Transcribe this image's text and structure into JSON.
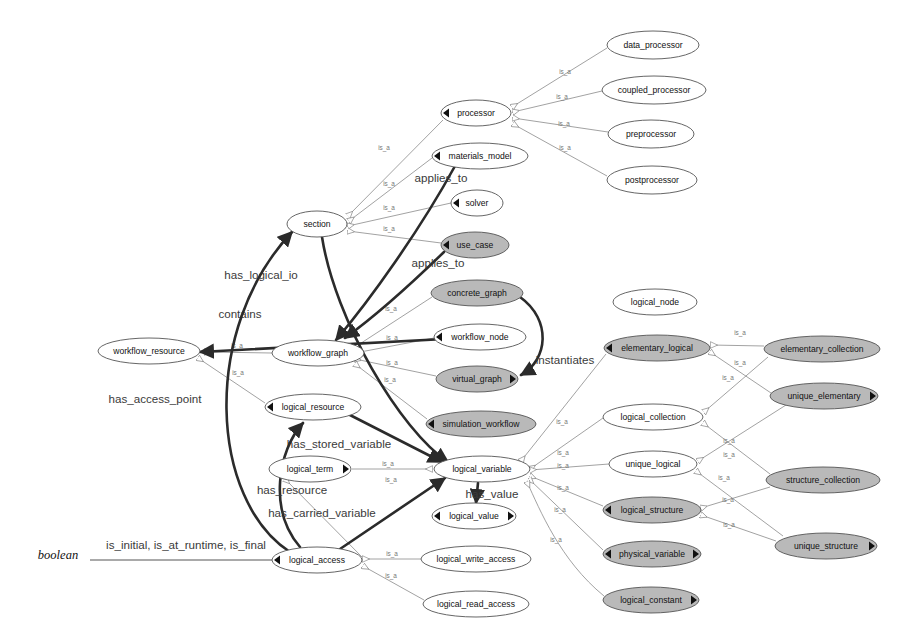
{
  "diagram": {
    "background": "#ffffff",
    "styles": {
      "node_fill_plain": "#ffffff",
      "node_fill_shaded": "#b9b9b9",
      "node_stroke": "#555555",
      "edge_isa_color": "#8a8a8a",
      "edge_rel_color": "#2b2b2b",
      "isa_label_color": "#777777",
      "rel_label_color": "#3a3a3a"
    },
    "legend_note": "white ellipse = plain class, gray ellipse = shaded class",
    "external_labels": [
      {
        "id": "boolean",
        "text": "boolean",
        "x": 58,
        "y": 559,
        "style": "italic"
      }
    ],
    "nodes": [
      {
        "id": "data_processor",
        "label": "data_processor",
        "cx": 653,
        "cy": 45,
        "rx": 46,
        "ry": 14,
        "shaded": false,
        "marker": "none"
      },
      {
        "id": "coupled_processor",
        "label": "coupled_processor",
        "cx": 654,
        "cy": 90,
        "rx": 52,
        "ry": 14,
        "shaded": false,
        "marker": "none"
      },
      {
        "id": "preprocessor",
        "label": "preprocessor",
        "cx": 651,
        "cy": 134,
        "rx": 43,
        "ry": 14,
        "shaded": false,
        "marker": "none"
      },
      {
        "id": "postprocessor",
        "label": "postprocessor",
        "cx": 652,
        "cy": 180,
        "rx": 45,
        "ry": 14,
        "shaded": false,
        "marker": "none"
      },
      {
        "id": "processor",
        "label": "processor",
        "cx": 476,
        "cy": 113,
        "rx": 35,
        "ry": 13,
        "shaded": false,
        "marker": "left"
      },
      {
        "id": "materials_model",
        "label": "materials_model",
        "cx": 480,
        "cy": 156,
        "rx": 48,
        "ry": 13,
        "shaded": false,
        "marker": "left"
      },
      {
        "id": "solver",
        "label": "solver",
        "cx": 477,
        "cy": 203,
        "rx": 26,
        "ry": 13,
        "shaded": false,
        "marker": "left"
      },
      {
        "id": "use_case",
        "label": "use_case",
        "cx": 475,
        "cy": 245,
        "rx": 34,
        "ry": 13,
        "shaded": true,
        "marker": "left"
      },
      {
        "id": "section",
        "label": "section",
        "cx": 317,
        "cy": 224,
        "rx": 30,
        "ry": 13,
        "shaded": false,
        "marker": "none"
      },
      {
        "id": "concrete_graph",
        "label": "concrete_graph",
        "cx": 477,
        "cy": 293,
        "rx": 46,
        "ry": 13,
        "shaded": true,
        "marker": "none"
      },
      {
        "id": "logical_node",
        "label": "logical_node",
        "cx": 655,
        "cy": 302,
        "rx": 42,
        "ry": 13,
        "shaded": false,
        "marker": "none"
      },
      {
        "id": "workflow_node",
        "label": "workflow_node",
        "cx": 480,
        "cy": 337,
        "rx": 46,
        "ry": 13,
        "shaded": false,
        "marker": "left"
      },
      {
        "id": "workflow_graph",
        "label": "workflow_graph",
        "cx": 318,
        "cy": 353,
        "rx": 46,
        "ry": 13,
        "shaded": false,
        "marker": "none"
      },
      {
        "id": "workflow_resource",
        "label": "workflow_resource",
        "cx": 149,
        "cy": 351,
        "rx": 51,
        "ry": 13,
        "shaded": false,
        "marker": "none"
      },
      {
        "id": "virtual_graph",
        "label": "virtual_graph",
        "cx": 477,
        "cy": 379,
        "rx": 41,
        "ry": 13,
        "shaded": true,
        "marker": "right"
      },
      {
        "id": "elementary_logical",
        "label": "elementary_logical",
        "cx": 657,
        "cy": 348,
        "rx": 53,
        "ry": 13,
        "shaded": true,
        "marker": "left"
      },
      {
        "id": "elementary_collection",
        "label": "elementary_collection",
        "cx": 822,
        "cy": 349,
        "rx": 58,
        "ry": 13,
        "shaded": true,
        "marker": "none"
      },
      {
        "id": "unique_elementary",
        "label": "unique_elementary",
        "cx": 824,
        "cy": 396,
        "rx": 54,
        "ry": 13,
        "shaded": true,
        "marker": "right"
      },
      {
        "id": "logical_collection",
        "label": "logical_collection",
        "cx": 653,
        "cy": 417,
        "rx": 50,
        "ry": 13,
        "shaded": false,
        "marker": "none"
      },
      {
        "id": "logical_resource",
        "label": "logical_resource",
        "cx": 313,
        "cy": 407,
        "rx": 48,
        "ry": 13,
        "shaded": false,
        "marker": "left"
      },
      {
        "id": "simulation_workflow",
        "label": "simulation_workflow",
        "cx": 481,
        "cy": 424,
        "rx": 55,
        "ry": 13,
        "shaded": true,
        "marker": "left"
      },
      {
        "id": "unique_logical",
        "label": "unique_logical",
        "cx": 653,
        "cy": 464,
        "rx": 44,
        "ry": 13,
        "shaded": false,
        "marker": "none"
      },
      {
        "id": "logical_term",
        "label": "logical_term",
        "cx": 310,
        "cy": 469,
        "rx": 41,
        "ry": 13,
        "shaded": false,
        "marker": "right"
      },
      {
        "id": "logical_variable",
        "label": "logical_variable",
        "cx": 482,
        "cy": 469,
        "rx": 48,
        "ry": 13,
        "shaded": false,
        "marker": "none"
      },
      {
        "id": "structure_collection",
        "label": "structure_collection",
        "cx": 823,
        "cy": 480,
        "rx": 57,
        "ry": 13,
        "shaded": true,
        "marker": "none"
      },
      {
        "id": "logical_structure",
        "label": "logical_structure",
        "cx": 652,
        "cy": 510,
        "rx": 49,
        "ry": 13,
        "shaded": true,
        "marker": "left"
      },
      {
        "id": "logical_value",
        "label": "logical_value",
        "cx": 474,
        "cy": 516,
        "rx": 42,
        "ry": 13,
        "shaded": false,
        "marker": "both"
      },
      {
        "id": "unique_structure",
        "label": "unique_structure",
        "cx": 826,
        "cy": 546,
        "rx": 51,
        "ry": 13,
        "shaded": true,
        "marker": "right"
      },
      {
        "id": "physical_variable",
        "label": "physical_variable",
        "cx": 652,
        "cy": 554,
        "rx": 49,
        "ry": 13,
        "shaded": true,
        "marker": "both"
      },
      {
        "id": "logical_access",
        "label": "logical_access",
        "cx": 317,
        "cy": 560,
        "rx": 45,
        "ry": 13,
        "shaded": false,
        "marker": "left"
      },
      {
        "id": "logical_write_access",
        "label": "logical_write_access",
        "cx": 476,
        "cy": 559,
        "rx": 55,
        "ry": 13,
        "shaded": false,
        "marker": "none"
      },
      {
        "id": "logical_constant",
        "label": "logical_constant",
        "cx": 651,
        "cy": 600,
        "rx": 48,
        "ry": 13,
        "shaded": true,
        "marker": "right"
      },
      {
        "id": "logical_read_access",
        "label": "logical_read_access",
        "cx": 476,
        "cy": 604,
        "rx": 53,
        "ry": 13,
        "shaded": false,
        "marker": "none"
      }
    ],
    "isa_edges": [
      {
        "from": "data_processor",
        "to": "processor",
        "label": "is_a",
        "lx": 565,
        "ly": 74,
        "path": "M607,48 L512,107"
      },
      {
        "from": "coupled_processor",
        "to": "processor",
        "label": "is_a",
        "lx": 562,
        "ly": 99,
        "path": "M602,91 L513,112"
      },
      {
        "from": "preprocessor",
        "to": "processor",
        "label": "is_a",
        "lx": 564,
        "ly": 126,
        "path": "M608,132 L513,118"
      },
      {
        "from": "postprocessor",
        "to": "processor",
        "label": "is_a",
        "lx": 565,
        "ly": 150,
        "path": "M607,176 L513,124"
      },
      {
        "from": "processor",
        "to": "section",
        "label": "is_a",
        "lx": 384,
        "ly": 150,
        "path": "M443,120 L348,216"
      },
      {
        "from": "materials_model",
        "to": "section",
        "label": "is_a",
        "lx": 389,
        "ly": 186,
        "path": "M432,158 L349,221"
      },
      {
        "from": "solver",
        "to": "section",
        "label": "is_a",
        "lx": 389,
        "ly": 210,
        "path": "M451,203 L348,226"
      },
      {
        "from": "use_case",
        "to": "section",
        "label": "is_a",
        "lx": 389,
        "ly": 231,
        "path": "M441,243 L348,231"
      },
      {
        "from": "concrete_graph",
        "to": "workflow_graph",
        "label": "is_a",
        "lx": 391,
        "ly": 311,
        "path": "M432,297 L355,347"
      },
      {
        "from": "workflow_node",
        "to": "workflow_graph",
        "label": "is_a",
        "lx": 392,
        "ly": 340,
        "path": "M434,338 L355,353"
      },
      {
        "from": "virtual_graph",
        "to": "workflow_graph",
        "label": "is_a",
        "lx": 392,
        "ly": 365,
        "path": "M436,376 L355,359"
      },
      {
        "from": "simulation_workflow",
        "to": "workflow_graph",
        "label": "is_a",
        "lx": 390,
        "ly": 382,
        "path": "M427,419 L355,364"
      },
      {
        "from": "workflow_graph",
        "to": "workflow_resource",
        "label": "is_a",
        "lx": 237,
        "ly": 348,
        "path": "M272,353 L205,352"
      },
      {
        "from": "logical_resource",
        "to": "workflow_resource",
        "label": "is_a",
        "lx": 238,
        "ly": 375,
        "path": "M265,403 L198,358"
      },
      {
        "from": "logical_term",
        "to": "logical_variable",
        "label": "is_a",
        "lx": 388,
        "ly": 466,
        "path": "M352,469 L432,469"
      },
      {
        "from": "logical_access",
        "to": "logical_term",
        "label": "is_a",
        "lx": 391,
        "ly": 482,
        "path": "M362,557 L285,479"
      },
      {
        "from": "logical_write_access",
        "to": "logical_access",
        "label": "is_a",
        "lx": 392,
        "ly": 556,
        "path": "M421,559 L363,559"
      },
      {
        "from": "logical_read_access",
        "to": "logical_access",
        "label": "is_a",
        "lx": 391,
        "ly": 578,
        "path": "M424,600 L363,566"
      },
      {
        "from": "elementary_collection",
        "to": "elementary_logical",
        "label": "is_a",
        "lx": 740,
        "ly": 335,
        "path": "M764,346 L711,345"
      },
      {
        "from": "unique_elementary",
        "to": "elementary_logical",
        "label": "is_a",
        "lx": 740,
        "ly": 365,
        "path": "M771,393 L710,352"
      },
      {
        "from": "elementary_collection",
        "to": "logical_collection",
        "label": "is_a",
        "lx": 728,
        "ly": 380,
        "path": "M768,357 L704,412"
      },
      {
        "from": "elementary_logical",
        "to": "logical_variable",
        "label": "is_a",
        "lx": 562,
        "ly": 424,
        "path": "M606,354 L521,461"
      },
      {
        "from": "logical_collection",
        "to": "logical_variable",
        "label": "is_a",
        "lx": 563,
        "ly": 455,
        "path": "M603,418 L530,469"
      },
      {
        "from": "unique_logical",
        "to": "logical_variable",
        "label": "is_a",
        "lx": 563,
        "ly": 468,
        "path": "M609,464 L530,470"
      },
      {
        "from": "unique_elementary",
        "to": "unique_logical",
        "label": "is_a",
        "lx": 729,
        "ly": 443,
        "path": "M786,405 L698,461"
      },
      {
        "from": "structure_collection",
        "to": "logical_collection",
        "label": "is_a",
        "lx": 729,
        "ly": 457,
        "path": "M770,474 L703,423"
      },
      {
        "from": "logical_structure",
        "to": "logical_variable",
        "label": "is_a",
        "lx": 563,
        "ly": 490,
        "path": "M603,506 L530,476"
      },
      {
        "from": "structure_collection",
        "to": "logical_structure",
        "label": "is_a",
        "lx": 728,
        "ly": 502,
        "path": "M770,487 L701,508"
      },
      {
        "from": "unique_structure",
        "to": "logical_structure",
        "label": "is_a",
        "lx": 729,
        "ly": 527,
        "path": "M776,541 L701,515"
      },
      {
        "from": "unique_structure",
        "to": "unique_logical",
        "label": "is_a",
        "lx": 724,
        "ly": 480,
        "path": "M783,536 L696,471"
      },
      {
        "from": "physical_variable",
        "to": "logical_variable",
        "label": "is_a",
        "lx": 560,
        "ly": 512,
        "path": "M603,550 L529,479"
      },
      {
        "from": "logical_constant",
        "to": "logical_variable",
        "label": "is_a",
        "lx": 556,
        "ly": 542,
        "path": "M604,596 C560,560 540,510 527,482"
      }
    ],
    "relation_edges": [
      {
        "label": "applies_to",
        "from": "materials_model",
        "to": "workflow_graph",
        "lx": 441,
        "ly": 182,
        "path": "M455,166 C420,230 370,300 336,340"
      },
      {
        "label": "applies_to",
        "from": "use_case",
        "to": "workflow_graph",
        "lx": 438,
        "ly": 267,
        "path": "M444,252 C410,285 370,320 345,338"
      },
      {
        "label": "has_logical_io",
        "from": "section",
        "to": "logical_variable",
        "lx": 261,
        "ly": 279,
        "path": "M322,237 C335,320 400,430 448,462"
      },
      {
        "label": "contains",
        "from": "workflow_graph",
        "to": "workflow_resource",
        "lx": 240,
        "ly": 318,
        "path": "M520,335 L200,352"
      },
      {
        "label": "instantiates",
        "from": "concrete_graph",
        "to": "virtual_graph",
        "lx": 565,
        "ly": 364,
        "path": "M520,297 C552,320 548,360 521,375"
      },
      {
        "label": "has_access_point",
        "from": "logical_access",
        "to": "section",
        "lx": 155,
        "ly": 403,
        "path": "M290,552 C210,500 200,330 292,232"
      },
      {
        "label": "has_stored_variable",
        "from": "logical_resource",
        "to": "logical_variable",
        "lx": 339,
        "ly": 448,
        "path": "M348,414 L442,462"
      },
      {
        "label": "has_resource",
        "from": "logical_access",
        "to": "logical_resource",
        "lx": 292,
        "ly": 494,
        "path": "M300,547 C268,510 278,450 303,423"
      },
      {
        "label": "has_carried_variable",
        "from": "logical_access",
        "to": "logical_variable",
        "lx": 322,
        "ly": 517,
        "path": "M340,549 L445,478"
      },
      {
        "label": "has_value",
        "from": "logical_variable",
        "to": "logical_value",
        "lx": 492,
        "ly": 498,
        "path": "M478,483 L476,503"
      }
    ],
    "attribute_edges": [
      {
        "label": "is_initial, is_at_runtime, is_final",
        "from": "boolean",
        "to": "logical_access",
        "lx": 186,
        "ly": 549,
        "path": "M90,560 L272,560"
      }
    ]
  }
}
